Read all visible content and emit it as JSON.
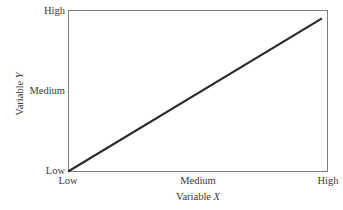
{
  "figure": {
    "background_color": "#ffffff",
    "frame_color": "#7d7d7d",
    "line_color": "#2b2b2b",
    "text_color": "#3a3a3a"
  },
  "axes": {
    "y": {
      "label_prefix": "Variable ",
      "label_letter": "Y",
      "ticks": {
        "high": "High",
        "medium": "Medium",
        "low": "Low"
      }
    },
    "x": {
      "label_prefix": "Variable ",
      "label_letter": "X",
      "ticks": {
        "low": "Low",
        "medium": "Medium",
        "high": "High"
      }
    }
  },
  "chart_data": {
    "type": "line",
    "title": "",
    "subtitle": "",
    "xlabel": "Variable X",
    "ylabel": "Variable Y",
    "xtick_labels": [
      "Low",
      "Medium",
      "High"
    ],
    "ytick_labels": [
      "Low",
      "Medium",
      "High"
    ],
    "xlim": [
      0,
      2
    ],
    "ylim": [
      0,
      2
    ],
    "grid": false,
    "legend": null,
    "annotations": [],
    "series": [
      {
        "name": "positive linear relationship",
        "x": [
          0,
          1,
          2
        ],
        "y": [
          0,
          1,
          2
        ],
        "color": "#2b2b2b",
        "line_width": 2,
        "marker": "none"
      }
    ]
  }
}
